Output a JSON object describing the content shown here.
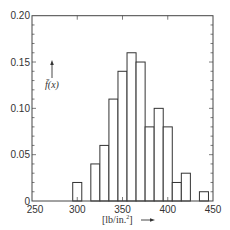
{
  "chart_data": {
    "type": "bar",
    "title": "",
    "xlabel": "[lb/in.²] →",
    "xlabel_unit": "[lb/in.",
    "xlabel_sup": "2",
    "xlabel_close": "]",
    "ylabel": "f̄(x)",
    "xlim": [
      250,
      450
    ],
    "ylim": [
      0,
      0.2
    ],
    "bin_width": 10,
    "x_ticks": [
      250,
      300,
      350,
      400,
      450
    ],
    "x_tick_labels": [
      "250",
      "300",
      "350",
      "400",
      "450"
    ],
    "y_ticks": [
      0,
      0.05,
      0.1,
      0.15,
      0.2
    ],
    "y_tick_labels": [
      "0",
      "0.05",
      "0.10",
      "0.15",
      "0.20"
    ],
    "categories": [
      300,
      310,
      320,
      330,
      340,
      350,
      360,
      370,
      380,
      390,
      400,
      410,
      420,
      430,
      440
    ],
    "values": [
      0.02,
      0.0,
      0.04,
      0.06,
      0.11,
      0.14,
      0.16,
      0.15,
      0.08,
      0.1,
      0.08,
      0.02,
      0.03,
      0.0,
      0.01
    ],
    "grid": false,
    "legend": null,
    "style": {
      "bar_fill": "#ffffff",
      "bar_stroke": "#333333",
      "axis_color": "#444444"
    }
  }
}
